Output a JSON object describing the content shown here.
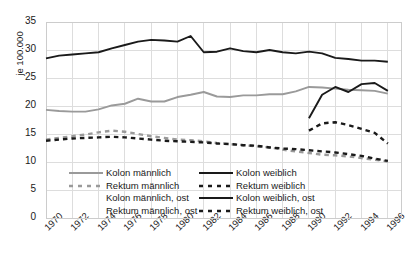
{
  "chart_data": {
    "type": "line",
    "title": "",
    "xlabel": "",
    "ylabel": "je 100.000",
    "ylim": [
      0,
      35
    ],
    "xlim": [
      1970,
      1997
    ],
    "grid": true,
    "legend_position": "lower-center-inside",
    "yticks": [
      "0",
      "5",
      "10",
      "15",
      "20",
      "25",
      "30",
      "35"
    ],
    "ytick_values": [
      0,
      5,
      10,
      15,
      20,
      25,
      30,
      35
    ],
    "categories": [
      1970,
      1971,
      1972,
      1973,
      1974,
      1975,
      1976,
      1977,
      1978,
      1979,
      1980,
      1981,
      1982,
      1983,
      1984,
      1985,
      1986,
      1987,
      1988,
      1989,
      1990,
      1991,
      1992,
      1993,
      1994,
      1995,
      1996
    ],
    "xticks": [
      "1970",
      "1972",
      "1974",
      "1976",
      "1978",
      "1980",
      "1982",
      "1984",
      "1986",
      "1988",
      "1990",
      "1992",
      "1994",
      "1996"
    ],
    "xtick_values": [
      1970,
      1972,
      1974,
      1976,
      1978,
      1980,
      1982,
      1984,
      1986,
      1988,
      1990,
      1992,
      1994,
      1996
    ],
    "series": [
      {
        "name": "Kolon männlich",
        "color": "#9a9a9a",
        "style": "solid",
        "x": [
          1970,
          1971,
          1972,
          1973,
          1974,
          1975,
          1976,
          1977,
          1978,
          1979,
          1980,
          1981,
          1982,
          1983,
          1984,
          1985,
          1986,
          1987,
          1988,
          1989,
          1990,
          1991,
          1992,
          1993,
          1994,
          1995,
          1996
        ],
        "values": [
          19.3,
          19.1,
          19.0,
          19.0,
          19.4,
          20.1,
          20.4,
          21.3,
          20.8,
          20.8,
          21.6,
          22.0,
          22.5,
          21.7,
          21.6,
          21.9,
          21.9,
          22.1,
          22.1,
          22.6,
          23.4,
          23.3,
          23.1,
          22.9,
          22.8,
          22.7,
          22.2
        ]
      },
      {
        "name": "Rektum männlich",
        "color": "#9a9a9a",
        "style": "dashed",
        "x": [
          1970,
          1971,
          1972,
          1973,
          1974,
          1975,
          1976,
          1977,
          1978,
          1979,
          1980,
          1981,
          1982,
          1983,
          1984,
          1985,
          1986,
          1987,
          1988,
          1989,
          1990,
          1991,
          1992,
          1993,
          1994,
          1995,
          1996
        ],
        "values": [
          14.0,
          14.3,
          14.6,
          14.9,
          15.3,
          15.6,
          15.4,
          15.0,
          14.6,
          14.3,
          14.0,
          13.9,
          13.7,
          13.4,
          13.2,
          13.0,
          12.8,
          12.6,
          12.2,
          11.9,
          11.6,
          11.3,
          11.2,
          11.0,
          10.7,
          10.4,
          10.1
        ]
      },
      {
        "name": "Kolon männlich, ost",
        "color": "#9a9a9a",
        "style": "solid-nosample",
        "x": [],
        "values": []
      },
      {
        "name": "Rektum männlich, ost",
        "color": "#9a9a9a",
        "style": "dashed-nosample",
        "x": [],
        "values": []
      },
      {
        "name": "Kolon weiblich",
        "color": "#1a1a1a",
        "style": "solid",
        "x": [
          1970,
          1971,
          1972,
          1973,
          1974,
          1975,
          1976,
          1977,
          1978,
          1979,
          1980,
          1981,
          1982,
          1983,
          1984,
          1985,
          1986,
          1987,
          1988,
          1989,
          1990,
          1991,
          1992,
          1993,
          1994,
          1995,
          1996
        ],
        "values": [
          28.5,
          29.0,
          29.2,
          29.4,
          29.6,
          30.3,
          30.9,
          31.5,
          31.8,
          31.7,
          31.5,
          32.5,
          29.6,
          29.7,
          30.3,
          29.8,
          29.6,
          30.0,
          29.6,
          29.4,
          29.7,
          29.4,
          28.6,
          28.4,
          28.1,
          28.1,
          27.9
        ]
      },
      {
        "name": "Rektum weiblich",
        "color": "#1a1a1a",
        "style": "dashed",
        "x": [
          1970,
          1971,
          1972,
          1973,
          1974,
          1975,
          1976,
          1977,
          1978,
          1979,
          1980,
          1981,
          1982,
          1983,
          1984,
          1985,
          1986,
          1987,
          1988,
          1989,
          1990,
          1991,
          1992,
          1993,
          1994,
          1995,
          1996
        ],
        "values": [
          13.8,
          14.0,
          14.2,
          14.3,
          14.4,
          14.5,
          14.4,
          14.2,
          14.0,
          13.8,
          13.7,
          13.6,
          13.5,
          13.3,
          13.2,
          13.0,
          12.9,
          12.6,
          12.4,
          12.3,
          12.1,
          11.9,
          11.7,
          11.4,
          11.1,
          10.6,
          10.2
        ]
      },
      {
        "name": "Kolon weiblich, ost",
        "color": "#1a1a1a",
        "style": "solid",
        "x": [
          1990,
          1991,
          1992,
          1993,
          1994,
          1995,
          1996
        ],
        "values": [
          17.8,
          22.0,
          23.4,
          22.5,
          23.9,
          24.1,
          22.7
        ]
      },
      {
        "name": "Rektum weiblich, ost",
        "color": "#1a1a1a",
        "style": "dashed",
        "x": [
          1990,
          1991,
          1992,
          1993,
          1994,
          1995,
          1996
        ],
        "values": [
          15.6,
          16.9,
          17.1,
          16.6,
          15.9,
          15.2,
          13.3
        ]
      }
    ]
  },
  "legend": {
    "col1": [
      {
        "label": "Kolon männlich",
        "color": "#9a9a9a",
        "style": "solid"
      },
      {
        "label": "Rektum männlich",
        "color": "#9a9a9a",
        "style": "dashed"
      },
      {
        "label": "Kolon männlich, ost",
        "color": "#ffffff",
        "style": "none"
      },
      {
        "label": "Rektum männlich, ost",
        "color": "#ffffff",
        "style": "none"
      }
    ],
    "col2": [
      {
        "label": "Kolon weiblich",
        "color": "#1a1a1a",
        "style": "solid"
      },
      {
        "label": "Rektum weiblich",
        "color": "#1a1a1a",
        "style": "dashed"
      },
      {
        "label": "Kolon weiblich, ost",
        "color": "#1a1a1a",
        "style": "solid"
      },
      {
        "label": "Rektum weiblich, ost",
        "color": "#1a1a1a",
        "style": "dashed"
      }
    ]
  },
  "colors": {
    "grid": "#dddddd",
    "frame": "#cccccc",
    "background": "#ffffff",
    "text": "#1a1a1a",
    "male": "#9a9a9a",
    "female": "#1a1a1a"
  }
}
